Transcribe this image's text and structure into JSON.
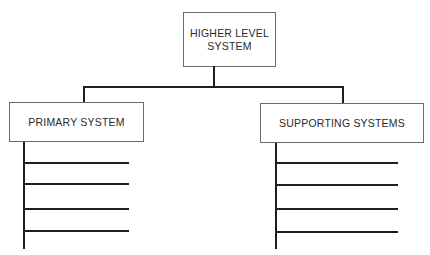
{
  "diagram": {
    "type": "hierarchy",
    "top": {
      "line1": "HIGHER LEVEL",
      "line2": "SYSTEM"
    },
    "children": [
      {
        "label": "PRIMARY SYSTEM",
        "sub_items": 4
      },
      {
        "label": "SUPPORTING SYSTEMS",
        "sub_items": 4
      }
    ]
  }
}
